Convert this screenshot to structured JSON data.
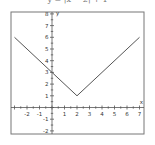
{
  "caption": "y = |x − 2| + 1",
  "chart_data": {
    "type": "line",
    "title": "",
    "xlabel": "x",
    "ylabel": "y",
    "xlim": [
      -3.1,
      7.2
    ],
    "ylim": [
      -2.1,
      8.1
    ],
    "xticks": [
      -2,
      -1,
      1,
      2,
      3,
      4,
      5,
      6,
      7
    ],
    "yticks": [
      -2,
      -1,
      1,
      2,
      3,
      4,
      5,
      6,
      7,
      8
    ],
    "grid": false,
    "series": [
      {
        "name": "y = |x - 2| + 1",
        "x": [
          -3,
          2,
          7
        ],
        "y": [
          6,
          1,
          6
        ]
      }
    ],
    "annotations": [
      "vertex at (2, 1)",
      "y-intercept (0, 3)"
    ]
  },
  "colors": {
    "line": "#555555",
    "axis": "#555555",
    "frame": "#777777"
  }
}
